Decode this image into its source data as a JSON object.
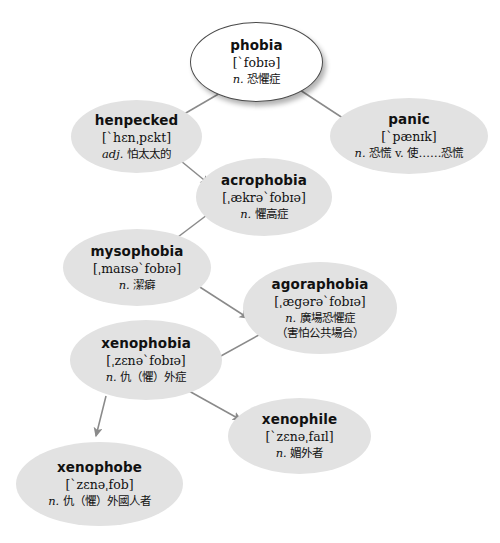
{
  "diagram": {
    "background_color": "#ffffff",
    "node_fill": "#e2e2e2",
    "root_fill": "#ffffff",
    "edge_color": "#8a8a8a"
  },
  "nodes": [
    {
      "id": "phobia",
      "word": "phobia",
      "ipa": "[ˋfobɪə]",
      "pos": "n.",
      "gloss": "恐懼症",
      "extra": "",
      "x": 190,
      "y": 22,
      "w": 133,
      "h": 80,
      "root": true
    },
    {
      "id": "henpecked",
      "word": "henpecked",
      "ipa": "[ˋhɛnˌpɛkt]",
      "pos": "adj.",
      "gloss": "怕太太的",
      "extra": "",
      "x": 71,
      "y": 100,
      "w": 131,
      "h": 73,
      "root": false
    },
    {
      "id": "panic",
      "word": "panic",
      "ipa": "[ˋpænɪk]",
      "pos": "n.",
      "gloss": "恐慌 v. 使……恐慌",
      "extra": "",
      "x": 330,
      "y": 98,
      "w": 158,
      "h": 76,
      "root": false
    },
    {
      "id": "acrophobia",
      "word": "acrophobia",
      "ipa": "[ˌækrəˋfobɪə]",
      "pos": "n.",
      "gloss": "懼高症",
      "extra": "",
      "x": 196,
      "y": 158,
      "w": 136,
      "h": 78,
      "root": false
    },
    {
      "id": "mysophobia",
      "word": "mysophobia",
      "ipa": "[ˌmaɪsəˋfobɪə]",
      "pos": "n.",
      "gloss": "潔癖",
      "extra": "",
      "x": 63,
      "y": 229,
      "w": 148,
      "h": 77,
      "root": false
    },
    {
      "id": "agoraphobia",
      "word": "agoraphobia",
      "ipa": "[ˌægərəˋfobɪə]",
      "pos": "n.",
      "gloss": "廣場恐懼症",
      "extra": "（害怕公共場合）",
      "x": 243,
      "y": 262,
      "w": 154,
      "h": 92,
      "root": false
    },
    {
      "id": "xenophobia",
      "word": "xenophobia",
      "ipa": "[ˌzɛnəˋfobɪə]",
      "pos": "n.",
      "gloss": "仇（懼）外症",
      "extra": "",
      "x": 70,
      "y": 320,
      "w": 152,
      "h": 80,
      "root": false
    },
    {
      "id": "xenophile",
      "word": "xenophile",
      "ipa": "[ˋzɛnəˌfaɪl]",
      "pos": "n.",
      "gloss": "媚外者",
      "extra": "",
      "x": 228,
      "y": 398,
      "w": 143,
      "h": 76,
      "root": false
    },
    {
      "id": "xenophobe",
      "word": "xenophobe",
      "ipa": "[ˋzɛnəˌfob]",
      "pos": "n.",
      "gloss": "仇（懼）外國人者",
      "extra": "",
      "x": 16,
      "y": 442,
      "w": 167,
      "h": 84,
      "root": false
    }
  ],
  "edges": [
    {
      "from": "phobia",
      "to": "henpecked",
      "x1": 222,
      "y1": 92,
      "x2": 160,
      "y2": 128
    },
    {
      "from": "phobia",
      "to": "panic",
      "x1": 300,
      "y1": 90,
      "x2": 355,
      "y2": 126
    },
    {
      "from": "henpecked",
      "to": "acrophobia",
      "x1": 170,
      "y1": 152,
      "x2": 209,
      "y2": 184
    },
    {
      "from": "acrophobia",
      "to": "mysophobia",
      "x1": 207,
      "y1": 215,
      "x2": 166,
      "y2": 246
    },
    {
      "from": "mysophobia",
      "to": "agoraphobia",
      "x1": 192,
      "y1": 282,
      "x2": 248,
      "y2": 318
    },
    {
      "from": "agoraphobia",
      "to": "xenophobia",
      "x1": 268,
      "y1": 330,
      "x2": 210,
      "y2": 362
    },
    {
      "from": "xenophobia",
      "to": "xenophile",
      "x1": 180,
      "y1": 386,
      "x2": 241,
      "y2": 420
    },
    {
      "from": "xenophobia",
      "to": "xenophobe",
      "x1": 106,
      "y1": 396,
      "x2": 96,
      "y2": 436
    }
  ]
}
